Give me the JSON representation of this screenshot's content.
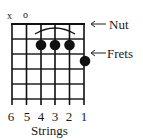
{
  "diagram": {
    "type": "guitar-chord-diagram",
    "open_muted_markers": [
      {
        "string": 6,
        "symbol": "x"
      },
      {
        "string": 5,
        "symbol": "o"
      }
    ],
    "labels": {
      "nut": "Nut",
      "frets": "Frets",
      "strings": "Strings"
    },
    "string_numbers": [
      "6",
      "5",
      "4",
      "3",
      "2",
      "1"
    ],
    "finger_positions": [
      {
        "string": 4,
        "fret": 2
      },
      {
        "string": 3,
        "fret": 2
      },
      {
        "string": 2,
        "fret": 2
      },
      {
        "string": 1,
        "fret": 3
      }
    ],
    "barre": {
      "from_string": 4,
      "to_string": 2,
      "fret": 2
    },
    "num_frets_shown": 5,
    "colors": {
      "ink": "#111111",
      "background": "#ffffff"
    }
  }
}
